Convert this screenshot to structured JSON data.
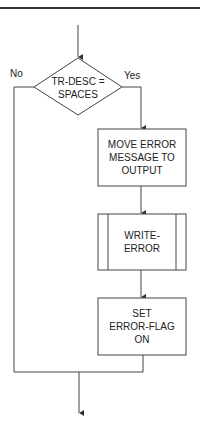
{
  "diagram": {
    "type": "flowchart",
    "decision": {
      "line1": "TR-DESC =",
      "line2": "SPACES",
      "no_label": "No",
      "yes_label": "Yes"
    },
    "steps": [
      {
        "shape": "process",
        "lines": [
          "MOVE ERROR",
          "MESSAGE TO",
          "OUTPUT"
        ]
      },
      {
        "shape": "predefined-process",
        "lines": [
          "WRITE-",
          "ERROR"
        ]
      },
      {
        "shape": "process",
        "lines": [
          "SET",
          "ERROR-FLAG",
          "ON"
        ]
      }
    ],
    "colors": {
      "stroke": "#444444",
      "text": "#222222",
      "background": "#ffffff"
    }
  }
}
